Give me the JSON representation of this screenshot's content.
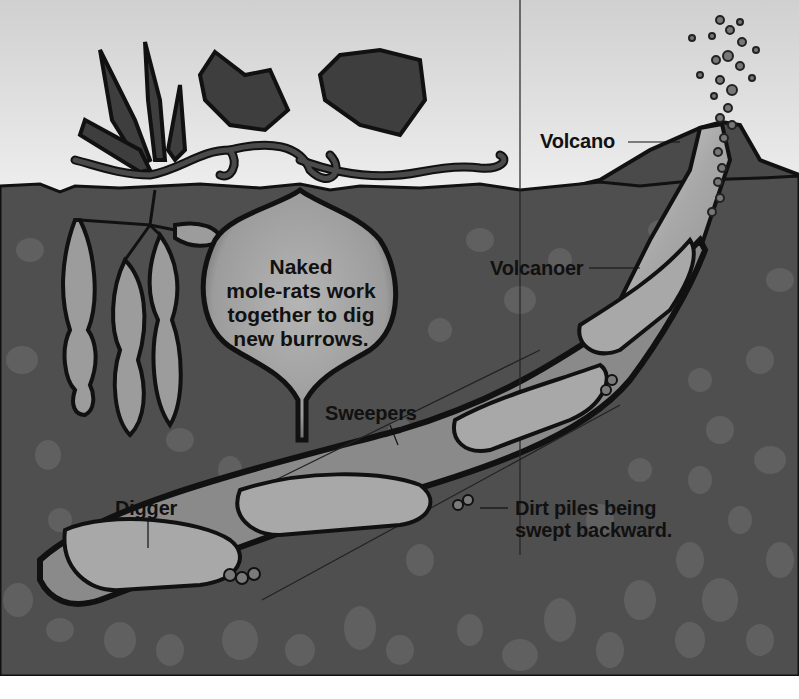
{
  "figure": {
    "caption_lines": [
      "Naked",
      "mole-rats work",
      "together to dig",
      "new burrows."
    ],
    "labels": {
      "volcano": "Volcano",
      "volcanoer": "Volcanoer",
      "sweepers": "Sweepers",
      "digger": "Digger",
      "dirt_piles_line1": "Dirt piles being",
      "dirt_piles_line2": "swept backward."
    },
    "colors": {
      "sky_top": "#d2d2d2",
      "sky_bottom": "#ededed",
      "soil": "#4f4f4f",
      "pebble": "#6a6a6a",
      "tunnel": "#8c8c8c",
      "mole_rat": "#a8a8a8",
      "outline": "#111111",
      "plant": "#3f3f3f",
      "bulb": "#9a9a9a",
      "page_bottom": "#ffffff"
    }
  }
}
